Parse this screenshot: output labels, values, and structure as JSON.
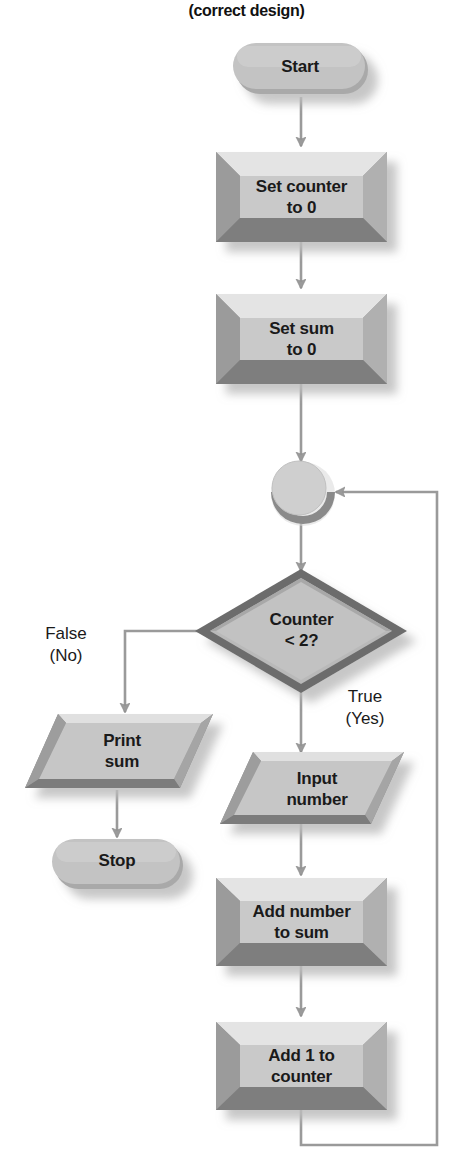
{
  "title": "(correct design)",
  "diagram": {
    "type": "flowchart",
    "orientation": "top-to-bottom",
    "palette": {
      "face": "#c6c6c6",
      "face_light": "#d4d4d4",
      "bevel_top": "#e2e2e2",
      "bevel_dark": "#8d8d8d",
      "bevel_darker": "#7a7a7a",
      "decision_border": "#6e6e6e",
      "line": "#8a8a8a",
      "shadow": "#d9d9d9",
      "text": "#1a1a1a",
      "background": "#ffffff"
    },
    "nodes": [
      {
        "id": "start",
        "shape": "terminator",
        "label": "Start"
      },
      {
        "id": "set_counter",
        "shape": "process",
        "label": "Set counter\nto 0"
      },
      {
        "id": "set_sum",
        "shape": "process",
        "label": "Set sum\nto 0"
      },
      {
        "id": "connector",
        "shape": "connector",
        "label": ""
      },
      {
        "id": "decision",
        "shape": "decision",
        "label": "Counter\n< 2?"
      },
      {
        "id": "print_sum",
        "shape": "io",
        "label": "Print\nsum"
      },
      {
        "id": "stop",
        "shape": "terminator",
        "label": "Stop"
      },
      {
        "id": "input_num",
        "shape": "io",
        "label": "Input\nnumber"
      },
      {
        "id": "add_number",
        "shape": "process",
        "label": "Add number\nto sum"
      },
      {
        "id": "add_counter",
        "shape": "process",
        "label": "Add 1 to\ncounter"
      }
    ],
    "edges": [
      {
        "from": "start",
        "to": "set_counter",
        "label": ""
      },
      {
        "from": "set_counter",
        "to": "set_sum",
        "label": ""
      },
      {
        "from": "set_sum",
        "to": "connector",
        "label": ""
      },
      {
        "from": "connector",
        "to": "decision",
        "label": ""
      },
      {
        "from": "decision",
        "to": "print_sum",
        "label": "False\n(No)"
      },
      {
        "from": "decision",
        "to": "input_num",
        "label": "True\n(Yes)"
      },
      {
        "from": "print_sum",
        "to": "stop",
        "label": ""
      },
      {
        "from": "input_num",
        "to": "add_number",
        "label": ""
      },
      {
        "from": "add_number",
        "to": "add_counter",
        "label": ""
      },
      {
        "from": "add_counter",
        "to": "connector",
        "label": ""
      }
    ],
    "edge_labels": {
      "false_branch": "False\n(No)",
      "true_branch": "True\n(Yes)"
    }
  }
}
